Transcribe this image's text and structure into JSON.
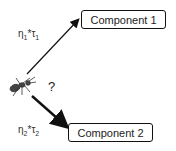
{
  "components": [
    {
      "label": "Component 1"
    },
    {
      "label": "Component 2"
    }
  ],
  "edges": [
    {
      "eta": "η",
      "eta_sub": "1",
      "op": "*",
      "tau": "τ",
      "tau_sub": "1"
    },
    {
      "eta": "η",
      "eta_sub": "2",
      "op": "*",
      "tau": "τ",
      "tau_sub": "2"
    }
  ],
  "question": "?",
  "agent_icon": "ant-icon"
}
